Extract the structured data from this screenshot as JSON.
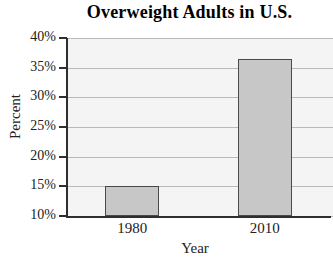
{
  "chart_data": {
    "type": "bar",
    "title": "Overweight Adults in U.S.",
    "xlabel": "Year",
    "ylabel": "Percent",
    "categories": [
      "1980",
      "2010"
    ],
    "values": [
      15,
      36.5
    ],
    "ylim": [
      10,
      40
    ],
    "yticks": [
      10,
      15,
      20,
      25,
      30,
      35,
      40
    ],
    "ytick_labels": [
      "10%",
      "15%",
      "20%",
      "25%",
      "30%",
      "35%",
      "40%"
    ],
    "grid": true,
    "legend": false,
    "colors": {
      "bar_fill": "#c7c7c7",
      "bar_border": "#4a4a4a",
      "plot_background": "#f4f4f4",
      "gridline": "#b9b9b9",
      "axis": "#2e2e2e",
      "text": "#222222",
      "title": "#000000"
    }
  }
}
